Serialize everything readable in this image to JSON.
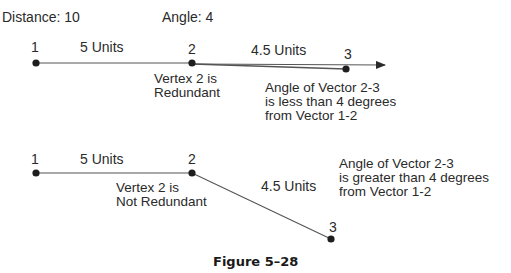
{
  "header": {
    "distance_label": "Distance: 10",
    "angle_label": "Angle: 4"
  },
  "example_redundant": {
    "vertices": [
      {
        "label": "1",
        "x": 36,
        "y": 63
      },
      {
        "label": "2",
        "x": 192,
        "y": 63
      },
      {
        "label": "3",
        "x": 346,
        "y": 69
      }
    ],
    "segment_1_2_label": "5 Units",
    "segment_2_3_label": "4.5 Units",
    "vertex_note": [
      "Vertex 2 is",
      "Redundant"
    ],
    "angle_note": [
      "Angle of Vector 2-3",
      "is less than 4 degrees",
      "from Vector 1-2"
    ]
  },
  "example_not_redundant": {
    "vertices": [
      {
        "label": "1",
        "x": 36,
        "y": 173
      },
      {
        "label": "2",
        "x": 192,
        "y": 173
      },
      {
        "label": "3",
        "x": 331,
        "y": 239
      }
    ],
    "segment_1_2_label": "5 Units",
    "segment_2_3_label": "4.5 Units",
    "vertex_note": [
      "Vertex 2 is",
      "Not Redundant"
    ],
    "angle_note": [
      "Angle of Vector 2-3",
      "is greater than 4 degrees",
      "from Vector 1-2"
    ]
  },
  "caption": "Figure 5–28",
  "colors": {
    "line": "#555555",
    "vertex": "#1e1e1e",
    "text": "#2a2a2a"
  }
}
